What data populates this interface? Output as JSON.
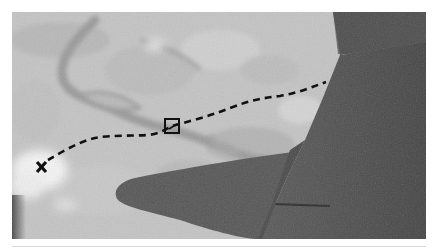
{
  "image": {
    "description": "Grayscale aerial photograph through an airplane window showing a river landscape below with the aircraft wing in the foreground; a dashed flight-path line runs from an X marker through a square marker to the wing edge.",
    "style": "grayscale"
  },
  "markers": {
    "start": {
      "label": "x",
      "symbol": "x-mark",
      "x": 42,
      "y": 167
    },
    "waypoint": {
      "symbol": "square",
      "x": 172,
      "y": 126,
      "size": 15
    }
  },
  "path": {
    "style": "dashed",
    "color": "#111111",
    "points": [
      [
        48,
        160
      ],
      [
        70,
        148
      ],
      [
        90,
        139
      ],
      [
        110,
        136
      ],
      [
        140,
        135
      ],
      [
        160,
        131
      ],
      [
        172,
        126
      ],
      [
        200,
        119
      ],
      [
        230,
        108
      ],
      [
        255,
        100
      ],
      [
        280,
        96
      ],
      [
        305,
        88
      ],
      [
        326,
        82
      ]
    ]
  },
  "colors": {
    "background": "#ffffff",
    "land_light": "#c9c9c9",
    "land_mid": "#b0b0b0",
    "river": "#9c9c9c",
    "wing_dark": "#4a4a4a",
    "wing_mid": "#585858",
    "cloud": "#f2f2f2"
  }
}
